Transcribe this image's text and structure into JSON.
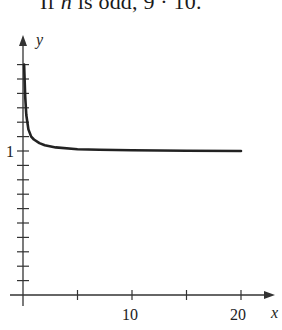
{
  "caption": {
    "prefix": "If ",
    "var": "n",
    "middle": " is odd, 9 · 10",
    "suffix": "."
  },
  "chart_data": {
    "type": "line",
    "title": "",
    "xlabel": "x",
    "ylabel": "y",
    "xlim": [
      0,
      21
    ],
    "ylim": [
      0,
      1.65
    ],
    "x_ticks": [
      5,
      10,
      15,
      20
    ],
    "x_tick_labels": [
      "10",
      "20"
    ],
    "x_tick_label_positions": [
      10,
      20
    ],
    "y_ticks": [
      0.1,
      0.2,
      0.3,
      0.4,
      0.5,
      0.6,
      0.7,
      0.8,
      0.9,
      1.0,
      1.1,
      1.2,
      1.3,
      1.4,
      1.5,
      1.6
    ],
    "y_tick_labels": [
      "1"
    ],
    "y_tick_label_positions": [
      1
    ],
    "grid": false,
    "legend": null,
    "series": [
      {
        "name": "curve",
        "x": [
          0.1,
          0.2,
          0.3,
          0.5,
          0.75,
          1,
          1.5,
          2,
          3,
          5,
          7,
          10,
          15,
          20
        ],
        "y": [
          1.6,
          1.38,
          1.25,
          1.15,
          1.1,
          1.08,
          1.055,
          1.04,
          1.025,
          1.012,
          1.008,
          1.005,
          1.002,
          1.0
        ]
      }
    ]
  },
  "labels": {
    "x_axis": "x",
    "y_axis": "y",
    "y_one": "1",
    "x_ten": "10",
    "x_twenty": "20"
  }
}
